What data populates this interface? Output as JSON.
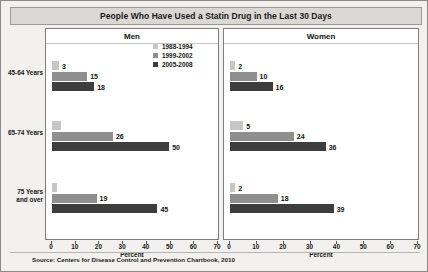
{
  "title": "People Who Have Used a Statin Drug in the Last 30 Days",
  "source": "Source: Centers for Disease Control and Prevention Chartbook, 2010",
  "legend": {
    "items": [
      {
        "label": "1988-1994",
        "color": "#c6c6c6"
      },
      {
        "label": "1999-2002",
        "color": "#8f8f8f"
      },
      {
        "label": "2005-2008",
        "color": "#3d3d3d"
      }
    ]
  },
  "panels": [
    {
      "key": "men",
      "header": "Men",
      "axis_title": "Percent"
    },
    {
      "key": "women",
      "header": "Women",
      "axis_title": "Percent"
    }
  ],
  "axis": {
    "ticks": [
      0,
      10,
      20,
      30,
      40,
      50,
      60,
      70
    ],
    "min": 0,
    "max": 70,
    "label": "Percent"
  },
  "categories": [
    {
      "line1": "45-64 Years",
      "line2": ""
    },
    {
      "line1": "65-74 Years",
      "line2": ""
    },
    {
      "line1": "75 Years",
      "line2": "and over"
    }
  ],
  "chart_data": {
    "type": "bar",
    "title": "People Who Have Used a Statin Drug in the Last 30 Days",
    "xlabel": "Percent",
    "ylabel": "",
    "xlim": [
      0,
      70
    ],
    "grid": false,
    "orientation": "horizontal",
    "legend_position": "top-center-left-of-panels",
    "categories": [
      "45-64 Years",
      "65-74 Years",
      "75 Years and over"
    ],
    "panels": [
      {
        "name": "Men",
        "series": [
          {
            "name": "1988-1994",
            "values": [
              3,
              4,
              2
            ],
            "labels": [
              "3",
              "",
              ""
            ]
          },
          {
            "name": "1999-2002",
            "values": [
              15,
              26,
              19
            ],
            "labels": [
              "15",
              "26",
              "19"
            ]
          },
          {
            "name": "2005-2008",
            "values": [
              18,
              50,
              45
            ],
            "labels": [
              "18",
              "50",
              "45"
            ]
          }
        ]
      },
      {
        "name": "Women",
        "series": [
          {
            "name": "1988-1994",
            "values": [
              2,
              5,
              2
            ],
            "labels": [
              "2",
              "5",
              "2"
            ]
          },
          {
            "name": "1999-2002",
            "values": [
              10,
              24,
              18
            ],
            "labels": [
              "10",
              "24",
              "18"
            ]
          },
          {
            "name": "2005-2008",
            "values": [
              16,
              36,
              39
            ],
            "labels": [
              "16",
              "36",
              "39"
            ]
          }
        ]
      }
    ],
    "source": "Source: Centers for Disease Control and Prevention Chartbook, 2010"
  }
}
